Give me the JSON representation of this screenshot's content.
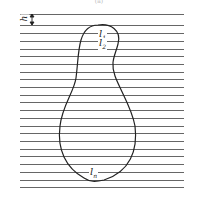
{
  "diagram": {
    "caption": "(a)",
    "spacing_label": "h",
    "labels": [
      {
        "base": "l",
        "sub": "1"
      },
      {
        "base": "l",
        "sub": "2"
      },
      {
        "base": "l",
        "sub": "n"
      }
    ],
    "line_color": "#555555",
    "curve_color": "#222222",
    "line_y": [
      14,
      25,
      33,
      41,
      49,
      56,
      64,
      72,
      79,
      87,
      95,
      102,
      110,
      118,
      126,
      133,
      141,
      149,
      156,
      164,
      172,
      180,
      187
    ]
  }
}
